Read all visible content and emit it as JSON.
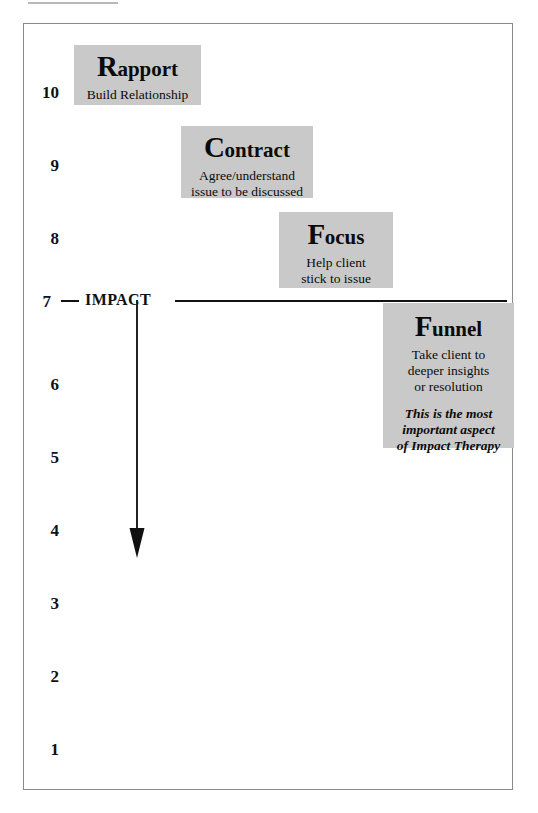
{
  "diagram": {
    "frame_color": "#8a8a8a",
    "box_fill_color": "#c9c9c9",
    "ink_color": "#111111",
    "scale": {
      "numbers": [
        "10",
        "9",
        "8",
        "7",
        "6",
        "5",
        "4",
        "3",
        "2",
        "1"
      ]
    },
    "impact_marker": {
      "number": "7",
      "label": "IMPACT"
    },
    "stages": [
      {
        "id": "rapport",
        "dropcap": "R",
        "rest": "apport",
        "full_title": "Rapport",
        "description": "Build Relationship",
        "note": ""
      },
      {
        "id": "contract",
        "dropcap": "C",
        "rest": "ontract",
        "full_title": "Contract",
        "description": "Agree/understand\nissue to be discussed",
        "note": ""
      },
      {
        "id": "focus",
        "dropcap": "F",
        "rest": "ocus",
        "full_title": "Focus",
        "description": "Help client\nstick to issue",
        "note": ""
      },
      {
        "id": "funnel",
        "dropcap": "F",
        "rest": "unnel",
        "full_title": "Funnel",
        "description": "Take client to\ndeeper insights\nor resolution",
        "note": "This is the most\nimportant aspect\nof Impact Therapy"
      }
    ],
    "arrow": {
      "name": "downward-depth-arrow",
      "direction": "down"
    }
  }
}
